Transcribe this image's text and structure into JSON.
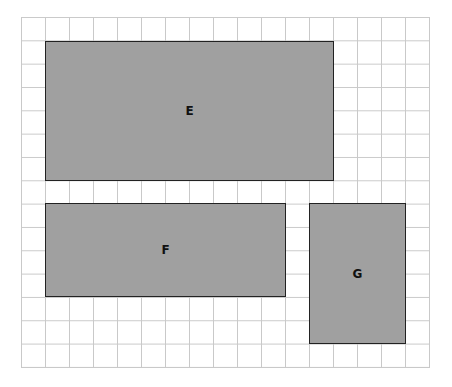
{
  "grid": {
    "columns": 17,
    "rows": 15,
    "line_color": "#c9c9c9"
  },
  "shapes": [
    {
      "label": "E",
      "col": 1,
      "row": 1,
      "width_cells": 12,
      "height_cells": 6,
      "fill": "#a0a0a0"
    },
    {
      "label": "F",
      "col": 1,
      "row": 8,
      "width_cells": 10,
      "height_cells": 4,
      "fill": "#a0a0a0"
    },
    {
      "label": "G",
      "col": 12,
      "row": 8,
      "width_cells": 4,
      "height_cells": 6,
      "fill": "#a0a0a0"
    }
  ]
}
